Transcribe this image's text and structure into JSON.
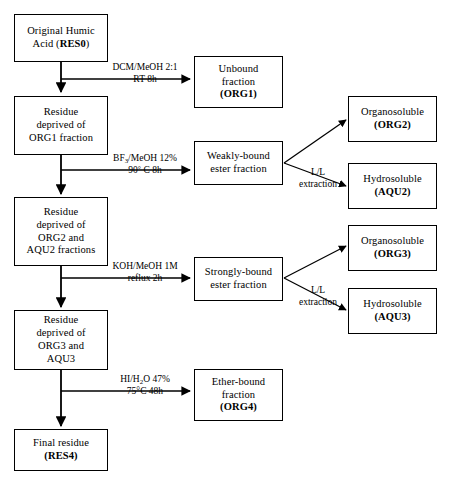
{
  "diagram": {
    "nodes": [
      {
        "id": "res0",
        "lines": [
          "Original Humic",
          "Acid (RES0)"
        ],
        "bold_lines": [
          0,
          0
        ],
        "bold_part": "(RES0)"
      },
      {
        "id": "res1",
        "lines": [
          "Residue",
          "deprived of",
          "ORG1 fraction"
        ]
      },
      {
        "id": "res2",
        "lines": [
          "Residue",
          "deprived of",
          "ORG2 and",
          "AQU2 fractions"
        ]
      },
      {
        "id": "res3",
        "lines": [
          "Residue",
          "deprived of",
          "ORG3 and",
          "AQU3"
        ]
      },
      {
        "id": "res4",
        "lines": [
          "Final residue",
          "(RES4)"
        ]
      },
      {
        "id": "org1",
        "lines": [
          "Unbound",
          "fraction",
          "(ORG1)"
        ]
      },
      {
        "id": "weak",
        "lines": [
          "Weakly-bound",
          "ester fraction"
        ]
      },
      {
        "id": "strong",
        "lines": [
          "Strongly-bound",
          "ester fraction"
        ]
      },
      {
        "id": "org4",
        "lines": [
          "Ether-bound",
          "fraction",
          "(ORG4)"
        ]
      },
      {
        "id": "org2",
        "lines": [
          "Organosoluble",
          "(ORG2)"
        ]
      },
      {
        "id": "aqu2",
        "lines": [
          "Hydrosoluble",
          "(AQU2)"
        ]
      },
      {
        "id": "org3",
        "lines": [
          "Organosoluble",
          "(ORG3)"
        ]
      },
      {
        "id": "aqu3",
        "lines": [
          "Hydrosoluble",
          "(AQU3)"
        ]
      }
    ],
    "node_text": {
      "res0_l1": "Original Humic",
      "res0_l2a": "Acid (",
      "res0_l2b": "RES0",
      "res0_l2c": ")",
      "res1_l1": "Residue",
      "res1_l2": "deprived of",
      "res1_l3": "ORG1 fraction",
      "res2_l1": "Residue",
      "res2_l2": "deprived of",
      "res2_l3": "ORG2 and",
      "res2_l4": "AQU2 fractions",
      "res3_l1": "Residue",
      "res3_l2": "deprived of",
      "res3_l3": "ORG3 and",
      "res3_l4": "AQU3",
      "res4_l1": "Final residue",
      "res4_l2": "(RES4)",
      "org1_l1": "Unbound",
      "org1_l2": "fraction",
      "org1_l3": "(ORG1)",
      "weak_l1": "Weakly-bound",
      "weak_l2": "ester fraction",
      "strong_l1": "Strongly-bound",
      "strong_l2": "ester fraction",
      "org4_l1": "Ether-bound",
      "org4_l2": "fraction",
      "org4_l3": "(ORG4)",
      "org2_l1": "Organosoluble",
      "org2_l2": "(ORG2)",
      "aqu2_l1": "Hydrosoluble",
      "aqu2_l2": "(AQU2)",
      "org3_l1": "Organosoluble",
      "org3_l2": "(ORG3)",
      "aqu3_l1": "Hydrosoluble",
      "aqu3_l2": "(AQU3)"
    },
    "edge_labels": {
      "step1_l1": "DCM/MeOH 2:1",
      "step1_l2": "RT 8h",
      "step2_l1a": "BF",
      "step2_l1b": "3",
      "step2_l1c": "/MeOH 12%",
      "step2_l2a": "90",
      "step2_l2b": "°",
      "step2_l2c": " C 8h",
      "step3_l1": "KOH/MeOH 1M",
      "step3_l2": "reflux 2h",
      "step4_l1a": "HI/H",
      "step4_l1b": "2",
      "step4_l1c": "O 47%",
      "step4_l2": "75°C 48h",
      "ll1_l1": "L/L",
      "ll1_l2": "extraction",
      "ll2_l1": "L/L",
      "ll2_l2": "extraction"
    },
    "colors": {
      "stroke": "#000000",
      "fill": "#ffffff",
      "text": "#000000"
    }
  }
}
